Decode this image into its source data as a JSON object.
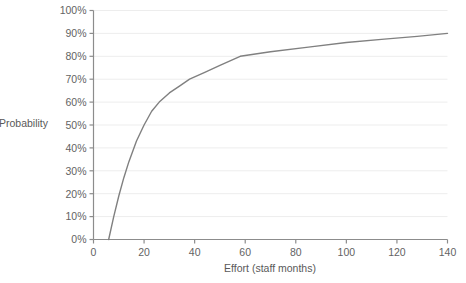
{
  "chart_data": {
    "type": "line",
    "title": "",
    "xlabel": "Effort (staff months)",
    "ylabel": "Probability",
    "xlim": [
      0,
      140
    ],
    "ylim": [
      0,
      100
    ],
    "grid": true,
    "legend": null,
    "xticks": [
      0,
      20,
      40,
      60,
      80,
      100,
      120,
      140
    ],
    "xtick_labels": [
      "0",
      "20",
      "40",
      "60",
      "80",
      "100",
      "120",
      "140"
    ],
    "yticks": [
      0,
      10,
      20,
      30,
      40,
      50,
      60,
      70,
      80,
      90,
      100
    ],
    "ytick_labels": [
      "0%",
      "10%",
      "20%",
      "30%",
      "40%",
      "50%",
      "60%",
      "70%",
      "80%",
      "90%",
      "100%"
    ],
    "series": [
      {
        "name": "Probability of completion",
        "color": "#808080",
        "x": [
          6,
          8,
          10,
          12,
          14,
          17,
          20,
          23,
          26,
          30,
          34,
          38,
          44,
          50,
          58,
          70,
          85,
          100,
          115,
          128,
          140
        ],
        "y": [
          0,
          10,
          19,
          27,
          34,
          43,
          50,
          56,
          60,
          64,
          67,
          70,
          73,
          76,
          80,
          82,
          84,
          86,
          87.5,
          88.7,
          90
        ]
      }
    ]
  },
  "axis": {
    "line_color": "#8c8c8c",
    "grid_color": "#ededed"
  }
}
